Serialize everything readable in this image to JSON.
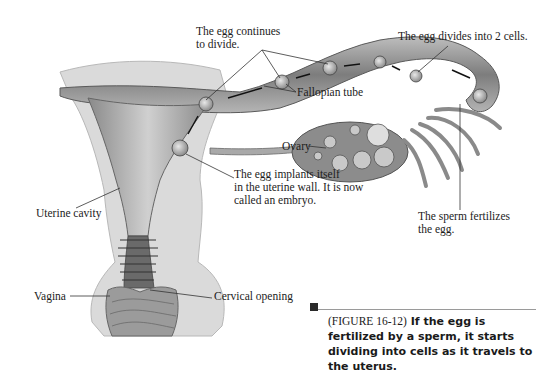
{
  "figure": {
    "labels": {
      "egg_continues": "The egg continues",
      "egg_continues_2": "to divide.",
      "egg_divides": "The egg divides into 2 cells.",
      "fallopian_tube": "Fallopian tube",
      "ovary": "Ovary",
      "egg_implants_1": "The egg implants itself",
      "egg_implants_2": "in the uterine wall.  It is now",
      "egg_implants_3": "called an embryo.",
      "sperm_fertilizes_1": "The sperm fertilizes",
      "sperm_fertilizes_2": "the egg.",
      "uterine_cavity": "Uterine cavity",
      "vagina": "Vagina",
      "cervical_opening": "Cervical opening"
    },
    "caption": {
      "figure_ref": "(FIGURE 16-12)",
      "text": " If the egg is fertilized by a sperm, it starts dividing into cells as it travels to the uterus."
    },
    "colors": {
      "tissue_light": "#d9d9d9",
      "tissue_mid": "#a8a8a8",
      "tissue_dark": "#6e6e6e",
      "outline": "#555555",
      "text": "#1c1c1c"
    }
  }
}
